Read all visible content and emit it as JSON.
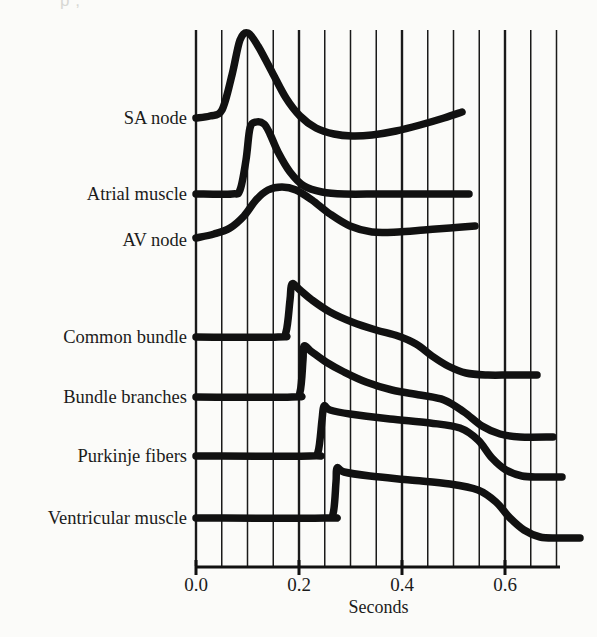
{
  "figure": {
    "ghost_text_top": "p        ,",
    "background_color": "#fbfbf9",
    "ink_color": "#111111",
    "gridline_color": "#1a1a1a"
  },
  "axis": {
    "title": "Seconds",
    "tick_labels": [
      "0.0",
      "0.2",
      "0.4",
      "0.6"
    ],
    "tick_values": [
      0.0,
      0.2,
      0.4,
      0.6
    ],
    "minor_tick_step": 0.05,
    "x_min": 0.0,
    "x_max": 0.73
  },
  "traces": [
    {
      "name": "sa-node",
      "label": "SA node"
    },
    {
      "name": "atrial-muscle",
      "label": "Atrial muscle"
    },
    {
      "name": "av-node",
      "label": "AV node"
    },
    {
      "name": "common-bundle",
      "label": "Common bundle"
    },
    {
      "name": "bundle-branches",
      "label": "Bundle branches"
    },
    {
      "name": "purkinje-fibers",
      "label": "Purkinje fibers"
    },
    {
      "name": "ventricular-muscle",
      "label": "Ventricular muscle"
    }
  ],
  "chart_data": {
    "type": "line",
    "title": "",
    "xlabel": "Seconds",
    "ylabel": "",
    "xlim": [
      0.0,
      0.73
    ],
    "grid": "vertical-only",
    "legend": "inline-left-labels",
    "tick_labels": [
      "0.0",
      "0.2",
      "0.4",
      "0.6"
    ],
    "series": [
      {
        "name": "SA node",
        "baseline_y_px": 118,
        "upstroke_time_s": 0.02,
        "peak_time_s": 0.085,
        "end_time_s": 0.59,
        "points_px": [
          [
            196,
            118
          ],
          [
            210,
            116
          ],
          [
            222,
            110
          ],
          [
            232,
            75
          ],
          [
            240,
            40
          ],
          [
            248,
            33
          ],
          [
            258,
            46
          ],
          [
            272,
            72
          ],
          [
            286,
            98
          ],
          [
            300,
            116
          ],
          [
            316,
            128
          ],
          [
            334,
            134
          ],
          [
            352,
            136
          ],
          [
            372,
            135
          ],
          [
            396,
            131
          ],
          [
            420,
            125
          ],
          [
            444,
            118
          ],
          [
            462,
            112
          ]
        ]
      },
      {
        "name": "Atrial muscle",
        "baseline_y_px": 194,
        "upstroke_time_s": 0.105,
        "peak_time_s": 0.13,
        "end_time_s": 0.53,
        "points_px": [
          [
            196,
            194
          ],
          [
            232,
            194
          ],
          [
            240,
            190
          ],
          [
            246,
            160
          ],
          [
            250,
            128
          ],
          [
            256,
            122
          ],
          [
            264,
            124
          ],
          [
            270,
            134
          ],
          [
            278,
            152
          ],
          [
            290,
            172
          ],
          [
            304,
            186
          ],
          [
            322,
            192
          ],
          [
            344,
            194
          ],
          [
            380,
            194
          ],
          [
            420,
            194
          ],
          [
            469,
            194
          ]
        ]
      },
      {
        "name": "AV node",
        "baseline_y_px": 232,
        "upstroke_time_s": 0.11,
        "peak_time_s": 0.2,
        "end_time_s": 0.54,
        "points_px": [
          [
            196,
            238
          ],
          [
            214,
            234
          ],
          [
            230,
            228
          ],
          [
            244,
            216
          ],
          [
            256,
            200
          ],
          [
            268,
            190
          ],
          [
            282,
            187
          ],
          [
            296,
            190
          ],
          [
            312,
            200
          ],
          [
            330,
            214
          ],
          [
            350,
            226
          ],
          [
            372,
            232
          ],
          [
            398,
            232
          ],
          [
            424,
            230
          ],
          [
            450,
            228
          ],
          [
            475,
            226
          ]
        ]
      },
      {
        "name": "Common bundle",
        "baseline_y_px": 337,
        "upstroke_time_s": 0.175,
        "end_time_s": 0.66,
        "points_px": [
          [
            196,
            337
          ],
          [
            278,
            337
          ],
          [
            286,
            332
          ],
          [
            290,
            300
          ],
          [
            292,
            284
          ],
          [
            300,
            290
          ],
          [
            312,
            300
          ],
          [
            330,
            312
          ],
          [
            352,
            322
          ],
          [
            376,
            330
          ],
          [
            398,
            336
          ],
          [
            416,
            344
          ],
          [
            432,
            356
          ],
          [
            448,
            366
          ],
          [
            466,
            373
          ],
          [
            488,
            375
          ],
          [
            510,
            375
          ],
          [
            537,
            375
          ]
        ]
      },
      {
        "name": "Bundle branches",
        "baseline_y_px": 397,
        "upstroke_time_s": 0.2,
        "end_time_s": 0.69,
        "points_px": [
          [
            196,
            397
          ],
          [
            292,
            397
          ],
          [
            300,
            392
          ],
          [
            303,
            360
          ],
          [
            304,
            346
          ],
          [
            312,
            352
          ],
          [
            326,
            362
          ],
          [
            344,
            372
          ],
          [
            366,
            382
          ],
          [
            392,
            390
          ],
          [
            420,
            395
          ],
          [
            444,
            400
          ],
          [
            464,
            412
          ],
          [
            482,
            426
          ],
          [
            500,
            434
          ],
          [
            520,
            437
          ],
          [
            553,
            437
          ]
        ]
      },
      {
        "name": "Purkinje fibers",
        "baseline_y_px": 456,
        "upstroke_time_s": 0.235,
        "end_time_s": 0.71,
        "points_px": [
          [
            196,
            456
          ],
          [
            310,
            456
          ],
          [
            318,
            452
          ],
          [
            322,
            420
          ],
          [
            324,
            406
          ],
          [
            330,
            410
          ],
          [
            350,
            414
          ],
          [
            390,
            419
          ],
          [
            430,
            423
          ],
          [
            460,
            428
          ],
          [
            478,
            440
          ],
          [
            492,
            458
          ],
          [
            506,
            470
          ],
          [
            522,
            476
          ],
          [
            540,
            477
          ],
          [
            562,
            477
          ]
        ]
      },
      {
        "name": "Ventricular muscle",
        "baseline_y_px": 518,
        "upstroke_time_s": 0.265,
        "end_time_s": 0.745,
        "points_px": [
          [
            196,
            518
          ],
          [
            325,
            518
          ],
          [
            333,
            514
          ],
          [
            336,
            482
          ],
          [
            337,
            468
          ],
          [
            344,
            472
          ],
          [
            370,
            476
          ],
          [
            410,
            480
          ],
          [
            450,
            484
          ],
          [
            478,
            490
          ],
          [
            496,
            502
          ],
          [
            510,
            518
          ],
          [
            524,
            530
          ],
          [
            540,
            537
          ],
          [
            558,
            538
          ],
          [
            580,
            538
          ]
        ]
      }
    ]
  }
}
